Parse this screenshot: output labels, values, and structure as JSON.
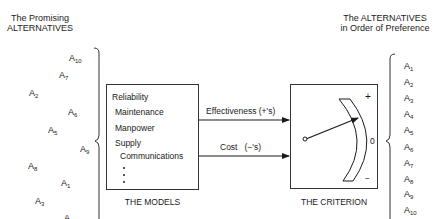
{
  "left_header": {
    "line1": "The Promising",
    "line2": "ALTERNATIVES"
  },
  "right_header": {
    "line1": "The ALTERNATIVES",
    "line2": "in Order of Preference"
  },
  "promising_alternatives": [
    {
      "letter": "A",
      "sub": "10"
    },
    {
      "letter": "A",
      "sub": "7"
    },
    {
      "letter": "A",
      "sub": "2"
    },
    {
      "letter": "A",
      "sub": "6"
    },
    {
      "letter": "A",
      "sub": "5"
    },
    {
      "letter": "A",
      "sub": "9"
    },
    {
      "letter": "A",
      "sub": "8"
    },
    {
      "letter": "A",
      "sub": "1"
    },
    {
      "letter": "A",
      "sub": "3"
    },
    {
      "letter": "A",
      "sub": "4"
    }
  ],
  "ordered_alternatives": [
    {
      "letter": "A",
      "sub": "1"
    },
    {
      "letter": "A",
      "sub": "2"
    },
    {
      "letter": "A",
      "sub": "3"
    },
    {
      "letter": "A",
      "sub": "4"
    },
    {
      "letter": "A",
      "sub": "5"
    },
    {
      "letter": "A",
      "sub": "6"
    },
    {
      "letter": "A",
      "sub": "7"
    },
    {
      "letter": "A",
      "sub": "8"
    },
    {
      "letter": "A",
      "sub": "9"
    },
    {
      "letter": "A",
      "sub": "10"
    }
  ],
  "models": {
    "items": [
      "Reliability",
      "Maintenance",
      "Manpower",
      "Supply",
      "Communications"
    ],
    "ellipsis": "⋮",
    "caption": "THE MODELS"
  },
  "arrows": {
    "effectiveness": "Effectiveness (+'s)",
    "cost": "Cost   (−'s)"
  },
  "criterion": {
    "caption": "THE CRITERION",
    "scale_plus": "+",
    "scale_zero": "0",
    "scale_minus": "−"
  },
  "colors": {
    "ink": "#1a1a1a",
    "background": "#ffffff"
  }
}
